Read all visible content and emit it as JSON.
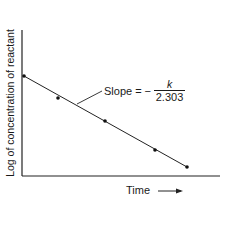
{
  "chart_data": {
    "type": "line",
    "title": "",
    "xlabel": "Time",
    "ylabel": "Log of concentration of reactant",
    "x_ticks": [],
    "y_ticks": [],
    "grid": false,
    "legend": null,
    "series": [
      {
        "name": "log[reactant] vs time",
        "markers": true,
        "points_px": [
          [
            24,
            76
          ],
          [
            58,
            98
          ],
          [
            105,
            121
          ],
          [
            155,
            150
          ],
          [
            187,
            167
          ]
        ],
        "x": [
          0,
          0.21,
          0.5,
          0.81,
          1.0
        ],
        "y": [
          1.0,
          0.85,
          0.7,
          0.51,
          0.39
        ]
      }
    ],
    "annotations": [
      {
        "text": "Slope = − k / 2.303",
        "slope_label": "Slope",
        "equals": "=",
        "minus": "−",
        "numerator": "k",
        "denominator": "2.303",
        "leader_line_to_px": [
          77,
          104
        ]
      }
    ],
    "axis_ranges": {
      "x": [
        0,
        1.2
      ],
      "y": [
        0,
        1.45
      ]
    }
  },
  "labels": {
    "y_axis": "Log of concentration of reactant",
    "x_axis": "Time"
  }
}
